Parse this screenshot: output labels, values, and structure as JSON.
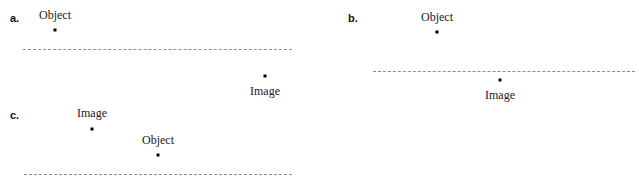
{
  "figure": {
    "width": 639,
    "height": 189,
    "background": "#ffffff",
    "dot_color": "#000000",
    "line_color": "#8c8c99",
    "text_color": "#1a1a1a"
  },
  "panels": [
    {
      "id": "a",
      "label": "a.",
      "label_x": 10,
      "label_y": 13,
      "axis": {
        "x": 23,
        "y": 49,
        "width": 269
      },
      "points": [
        {
          "name": "object",
          "label": "Object",
          "dot_x": 55,
          "dot_y": 30,
          "label_x": 55,
          "label_y": 9,
          "label_position": "above"
        },
        {
          "name": "image",
          "label": "Image",
          "dot_x": 265,
          "dot_y": 76,
          "label_x": 265,
          "label_y": 85,
          "label_position": "below"
        }
      ]
    },
    {
      "id": "b",
      "label": "b.",
      "label_x": 348,
      "label_y": 13,
      "axis": {
        "x": 373,
        "y": 71,
        "width": 262
      },
      "points": [
        {
          "name": "object",
          "label": "Object",
          "dot_x": 437,
          "dot_y": 32,
          "label_x": 437,
          "label_y": 11,
          "label_position": "above"
        },
        {
          "name": "image",
          "label": "Image",
          "dot_x": 500,
          "dot_y": 80,
          "label_x": 500,
          "label_y": 89,
          "label_position": "below"
        }
      ]
    },
    {
      "id": "c",
      "label": "c.",
      "label_x": 10,
      "label_y": 110,
      "axis": {
        "x": 24,
        "y": 174,
        "width": 268
      },
      "points": [
        {
          "name": "image",
          "label": "Image",
          "dot_x": 92,
          "dot_y": 129,
          "label_x": 92,
          "label_y": 107,
          "label_position": "above"
        },
        {
          "name": "object",
          "label": "Object",
          "dot_x": 158,
          "dot_y": 155,
          "label_x": 158,
          "label_y": 134,
          "label_position": "above"
        }
      ]
    }
  ]
}
